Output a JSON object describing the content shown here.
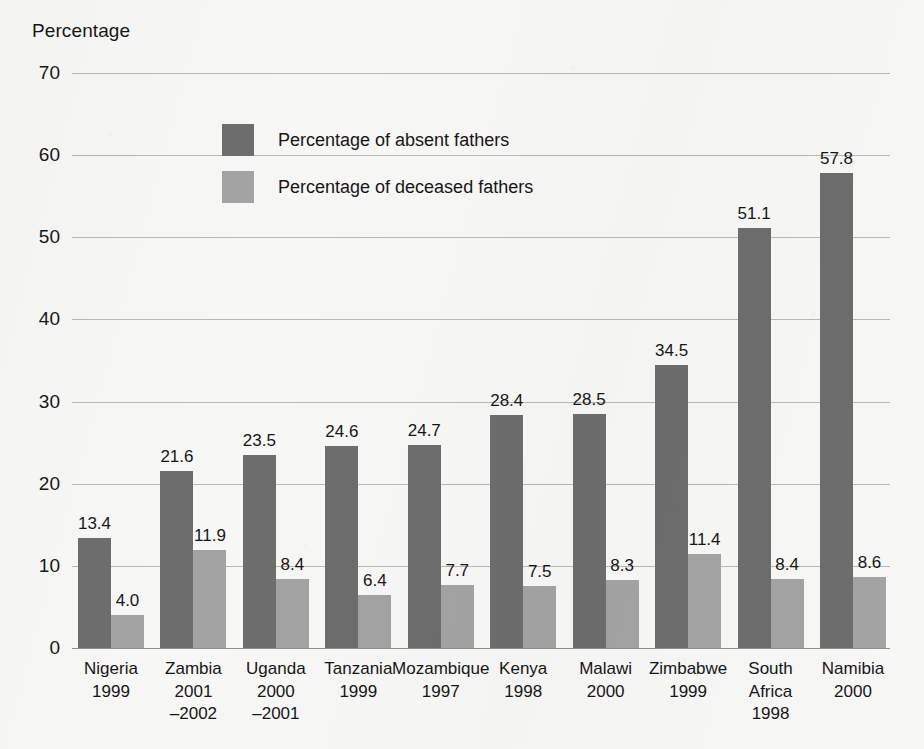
{
  "chart_data": {
    "type": "bar",
    "title": "",
    "ylabel": "Percentage",
    "xlabel": "",
    "ylim": [
      0,
      70
    ],
    "yticks": [
      0,
      10,
      20,
      30,
      40,
      50,
      60,
      70
    ],
    "grid": true,
    "legend_position": "inside-top-left",
    "categories": [
      "Nigeria 1999",
      "Zambia 2001 –2002",
      "Uganda 2000 –2001",
      "Tanzania 1999",
      "Mozambique 1997",
      "Kenya 1998",
      "Malawi 2000",
      "Zimbabwe 1999",
      "South Africa 1998",
      "Namibia 2000"
    ],
    "category_parts": [
      {
        "name": "Nigeria",
        "year": "1999",
        "year2": ""
      },
      {
        "name": "Zambia",
        "year": "2001",
        "year2": "–2002"
      },
      {
        "name": "Uganda",
        "year": "2000",
        "year2": "–2001"
      },
      {
        "name": "Tanzania",
        "year": "1999",
        "year2": ""
      },
      {
        "name": "Mozambique",
        "year": "1997",
        "year2": ""
      },
      {
        "name": "Kenya",
        "year": "1998",
        "year2": ""
      },
      {
        "name": "Malawi",
        "year": "2000",
        "year2": ""
      },
      {
        "name": "Zimbabwe",
        "year": "1999",
        "year2": ""
      },
      {
        "name": "South",
        "year": "Africa",
        "year2": "1998"
      },
      {
        "name": "Namibia",
        "year": "2000",
        "year2": ""
      }
    ],
    "series": [
      {
        "name": "Percentage of absent fathers",
        "color": "#6d6d6d",
        "values": [
          13.4,
          21.6,
          23.5,
          24.6,
          24.7,
          28.4,
          28.5,
          34.5,
          51.1,
          57.8
        ],
        "labels": [
          "13.4",
          "21.6",
          "23.5",
          "24.6",
          "24.7",
          "28.4",
          "28.5",
          "34.5",
          "51.1",
          "57.8"
        ]
      },
      {
        "name": "Percentage of deceased fathers",
        "color": "#a3a3a3",
        "values": [
          4.0,
          11.9,
          8.4,
          6.4,
          7.7,
          7.5,
          8.3,
          11.4,
          8.4,
          8.6
        ],
        "labels": [
          "4.0",
          "11.9",
          "8.4",
          "6.4",
          "7.7",
          "7.5",
          "8.3",
          "11.4",
          "8.4",
          "8.6"
        ]
      }
    ]
  },
  "legend": {
    "items": [
      {
        "label": "Percentage of absent fathers",
        "color": "#6d6d6d"
      },
      {
        "label": "Percentage of deceased fathers",
        "color": "#a3a3a3"
      }
    ]
  },
  "colors": {
    "background": "#f7f7f5",
    "absent_bar": "#6d6d6d",
    "deceased_bar": "#a3a3a3",
    "gridline": "#b9b9b4",
    "text": "#161616"
  }
}
